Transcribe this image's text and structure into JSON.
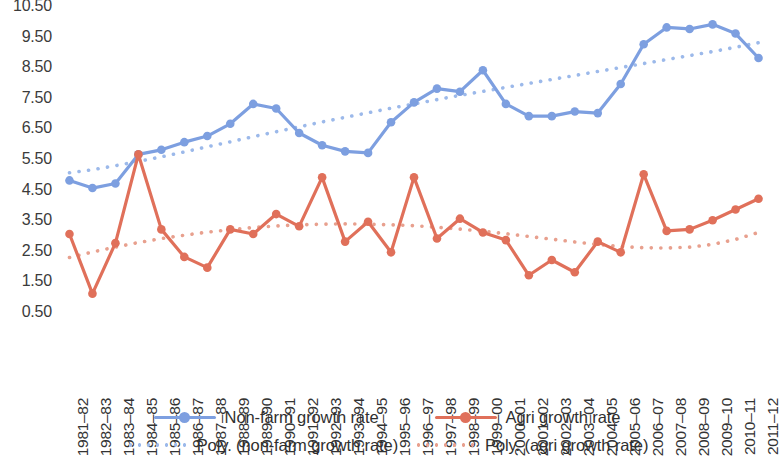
{
  "chart_data": {
    "type": "line",
    "title": "",
    "subtitle": "",
    "xlabel": "",
    "ylabel": "",
    "grid": false,
    "legend_position": "bottom",
    "ylim": [
      0.5,
      10.5
    ],
    "ytick_labels": [
      "10.50",
      "9.50",
      "8.50",
      "7.50",
      "6.50",
      "5.50",
      "4.50",
      "3.50",
      "2.50",
      "1.50",
      "0.50"
    ],
    "ytick_values": [
      10.5,
      9.5,
      8.5,
      7.5,
      6.5,
      5.5,
      4.5,
      3.5,
      2.5,
      1.5,
      0.5
    ],
    "categories": [
      "1981–82",
      "1982–83",
      "1983–84",
      "1984–85",
      "1985–86",
      "1986–87",
      "1987–88",
      "1988–89",
      "1989–90",
      "1990–91",
      "1991–92",
      "1992–93",
      "1993–94",
      "1994–95",
      "1995–96",
      "1996–97",
      "1997–98",
      "1998–99",
      "1999–00",
      "2000–01",
      "2001–02",
      "2002–03",
      "2003–04",
      "2004–05",
      "2005–06",
      "2006–07",
      "2007–08",
      "2008–09",
      "2009–10",
      "2010–11",
      "2011–12"
    ],
    "series": [
      {
        "name": "Non-farm growth rate",
        "kind": "line-marker",
        "color": "#7d9fe0",
        "values": [
          4.8,
          4.55,
          4.7,
          5.65,
          5.8,
          6.05,
          6.25,
          6.65,
          7.3,
          7.15,
          6.35,
          5.95,
          5.75,
          5.7,
          6.7,
          7.35,
          7.8,
          7.7,
          8.4,
          7.3,
          6.9,
          6.9,
          7.05,
          7.0,
          7.95,
          9.25,
          9.8,
          9.75,
          9.9,
          9.6,
          8.8
        ]
      },
      {
        "name": "Agri growth rate",
        "kind": "line-marker",
        "color": "#e0705a",
        "values": [
          3.05,
          1.1,
          2.75,
          5.65,
          3.2,
          2.3,
          1.95,
          3.2,
          3.05,
          3.7,
          3.3,
          4.9,
          2.8,
          3.45,
          2.45,
          4.9,
          2.9,
          3.55,
          3.1,
          2.85,
          1.7,
          2.2,
          1.8,
          2.8,
          2.45,
          5.0,
          3.15,
          3.2,
          3.5,
          3.85,
          4.2
        ]
      },
      {
        "name": "Poly. (non-farm growth rate)",
        "kind": "dotted-trend",
        "color": "#9cb9ea",
        "values": [
          5.05,
          5.15,
          5.28,
          5.42,
          5.57,
          5.73,
          5.9,
          6.06,
          6.23,
          6.39,
          6.55,
          6.71,
          6.86,
          7.01,
          7.16,
          7.3,
          7.44,
          7.58,
          7.71,
          7.84,
          7.97,
          8.1,
          8.23,
          8.36,
          8.49,
          8.62,
          8.75,
          8.88,
          9.01,
          9.15,
          9.3
        ]
      },
      {
        "name": "Poly. (agri growth rate)",
        "kind": "dotted-trend",
        "color": "#e8a08e",
        "values": [
          2.28,
          2.46,
          2.62,
          2.77,
          2.9,
          3.01,
          3.11,
          3.19,
          3.26,
          3.31,
          3.35,
          3.37,
          3.38,
          3.37,
          3.35,
          3.32,
          3.27,
          3.21,
          3.14,
          3.06,
          2.97,
          2.88,
          2.79,
          2.71,
          2.64,
          2.6,
          2.59,
          2.62,
          2.71,
          2.87,
          3.1
        ]
      }
    ],
    "legend": [
      {
        "label": "Non-farm growth rate",
        "color": "#7d9fe0",
        "style": "solid-marker"
      },
      {
        "label": "Agri growth rate",
        "color": "#e0705a",
        "style": "solid-marker"
      },
      {
        "label": "Poly. (non-farm growth rate)",
        "color": "#9cb9ea",
        "style": "dotted"
      },
      {
        "label": "Poly. (agri growth rate)",
        "color": "#e8a08e",
        "style": "dotted"
      }
    ]
  }
}
